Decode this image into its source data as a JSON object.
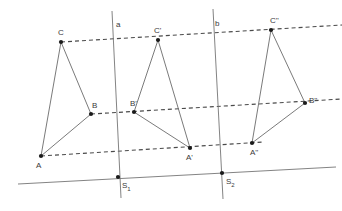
{
  "figure": {
    "type": "geometry-construction",
    "width": 342,
    "height": 211,
    "background_color": "#ffffff",
    "solid_stroke_color": "#6b6b6b",
    "dashed_stroke_color": "#4a4a4a",
    "point_color": "#1a1a1a",
    "label_color": "#3a3a3a"
  },
  "points": [
    {
      "id": "A",
      "label": "A",
      "x": 41,
      "y": 156,
      "label_x": 36,
      "label_y": 168
    },
    {
      "id": "B",
      "label": "B",
      "x": 91,
      "y": 114,
      "label_x": 92,
      "label_y": 108
    },
    {
      "id": "C",
      "label": "C",
      "x": 61,
      "y": 42,
      "label_x": 58,
      "label_y": 35
    },
    {
      "id": "A1",
      "label": "A'",
      "x": 190,
      "y": 148,
      "label_x": 186,
      "label_y": 160
    },
    {
      "id": "B1",
      "label": "B'",
      "x": 134,
      "y": 112,
      "label_x": 130,
      "label_y": 106
    },
    {
      "id": "C1",
      "label": "C'",
      "x": 158,
      "y": 40,
      "label_x": 154,
      "label_y": 33
    },
    {
      "id": "A2",
      "label": "A''",
      "x": 252,
      "y": 143,
      "label_x": 250,
      "label_y": 155
    },
    {
      "id": "B2",
      "label": "B''",
      "x": 305,
      "y": 103,
      "label_x": 309,
      "label_y": 103
    },
    {
      "id": "C2",
      "label": "C''",
      "x": 271,
      "y": 30,
      "label_x": 270,
      "label_y": 23
    },
    {
      "id": "S1",
      "label": "S",
      "sub": "1",
      "x": 118,
      "y": 177,
      "label_x": 122,
      "label_y": 188
    },
    {
      "id": "S2",
      "label": "S",
      "sub": "2",
      "x": 222,
      "y": 173,
      "label_x": 226,
      "label_y": 184
    }
  ],
  "lines": {
    "axis_a": {
      "label": "a",
      "label_x": 116,
      "label_y": 27,
      "x1": 112,
      "y1": 11,
      "x2": 121,
      "y2": 198
    },
    "axis_b": {
      "label": "b",
      "label_x": 215,
      "label_y": 26,
      "x1": 213,
      "y1": 9,
      "x2": 223,
      "y2": 199
    },
    "baseline": {
      "label": "",
      "x1": 18,
      "y1": 184,
      "x2": 336,
      "y2": 167
    }
  },
  "triangles": [
    {
      "id": "t0",
      "vertices": [
        "A",
        "B",
        "C"
      ]
    },
    {
      "id": "t1",
      "vertices": [
        "A1",
        "B1",
        "C1"
      ]
    },
    {
      "id": "t2",
      "vertices": [
        "A2",
        "B2",
        "C2"
      ]
    }
  ],
  "dashed_connectors": [
    {
      "id": "d-C",
      "from_x": 61,
      "from_y": 42,
      "to_x": 342,
      "to_y": 25,
      "name": "dashed-line-through-C"
    },
    {
      "id": "d-B",
      "from_x": 91,
      "from_y": 114,
      "to_x": 342,
      "to_y": 99,
      "name": "dashed-line-through-B"
    },
    {
      "id": "d-A",
      "from_x": 41,
      "from_y": 156,
      "to_x": 264,
      "to_y": 142,
      "name": "dashed-line-through-A"
    }
  ]
}
